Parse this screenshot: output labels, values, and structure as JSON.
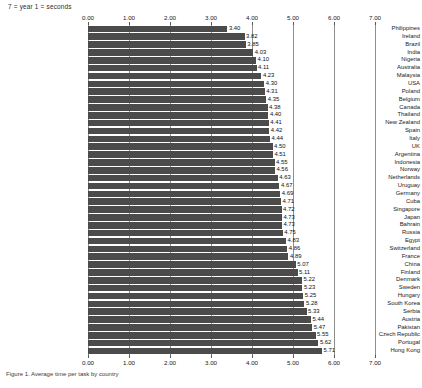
{
  "note": "7 = year  1 = seconds",
  "caption": "Figure 1. Average time per task by country",
  "chart_data": {
    "type": "bar",
    "orientation": "horizontal",
    "title": "",
    "xlabel": "",
    "ylabel": "",
    "xlim": [
      0.0,
      7.0
    ],
    "xticks": [
      "0.00",
      "1.00",
      "2.00",
      "3.00",
      "4.00",
      "5.00",
      "6.00",
      "7.00"
    ],
    "grid": true,
    "gridlines_at": [
      0.0,
      1.0,
      2.0,
      3.0,
      4.0,
      5.0,
      6.0,
      7.0
    ],
    "axis_positions": [
      "top",
      "bottom"
    ],
    "legend": null,
    "bar_color": "#4b4b4b",
    "categories": [
      "Philippines",
      "Ireland",
      "Brazil",
      "India",
      "Nigeria",
      "Australia",
      "Malaysia",
      "USA",
      "Poland",
      "Belgium",
      "Canada",
      "Thailand",
      "New Zealand",
      "Spain",
      "Italy",
      "UK",
      "Argentina",
      "Indonesia",
      "Norway",
      "Netherlands",
      "Uruguay",
      "Germany",
      "Cuba",
      "Singapore",
      "Japan",
      "Bahrain",
      "Russia",
      "Egypt",
      "Switzerland",
      "France",
      "China",
      "Finland",
      "Denmark",
      "Sweden",
      "Hungary",
      "South Korea",
      "Serbia",
      "Austria",
      "Pakistan",
      "Czech Republic",
      "Portugal",
      "Hong Kong"
    ],
    "values": [
      3.4,
      3.82,
      3.85,
      4.03,
      4.1,
      4.11,
      4.23,
      4.3,
      4.31,
      4.35,
      4.38,
      4.4,
      4.41,
      4.42,
      4.44,
      4.5,
      4.51,
      4.55,
      4.56,
      4.63,
      4.67,
      4.69,
      4.71,
      4.72,
      4.73,
      4.73,
      4.75,
      4.83,
      4.86,
      4.89,
      5.07,
      5.11,
      5.22,
      5.23,
      5.25,
      5.28,
      5.33,
      5.44,
      5.47,
      5.55,
      5.62,
      5.71
    ],
    "value_labels": [
      "3.40",
      "3.82",
      "3.85",
      "4.03",
      "4.10",
      "4.11",
      "4.23",
      "4.30",
      "4.31",
      "4.35",
      "4.38",
      "4.40",
      "4.41",
      "4.42",
      "4.44",
      "4.50",
      "4.51",
      "4.55",
      "4.56",
      "4.63",
      "4.67",
      "4.69",
      "4.71",
      "4.72",
      "4.73",
      "4.73",
      "4.75",
      "4.83",
      "4.86",
      "4.89",
      "5.07",
      "5.11",
      "5.22",
      "5.23",
      "5.25",
      "5.28",
      "5.33",
      "5.44",
      "5.47",
      "5.55",
      "5.62",
      "5.71"
    ]
  }
}
